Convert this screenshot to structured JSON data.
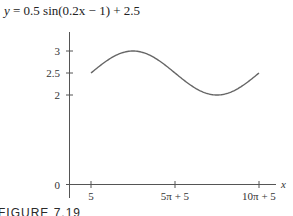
{
  "title": {
    "prefix": "y",
    "equation": " = 0.5 sin(0.2x − 1) + 2.5"
  },
  "caption": "FIGURE 7.19",
  "chart_data": {
    "type": "line",
    "title": "y = 0.5 sin(0.2x − 1) + 2.5",
    "xlabel": "x",
    "ylabel": "",
    "function": "0.5*sin(0.2*x - 1) + 2.5",
    "x_domain": [
      5,
      36.4159
    ],
    "x_ticks": [
      {
        "value": 5,
        "label": "5"
      },
      {
        "value": 20.708,
        "label": "5π + 5"
      },
      {
        "value": 36.416,
        "label": "10π + 5"
      }
    ],
    "y_ticks": [
      {
        "value": 0,
        "label": "0"
      },
      {
        "value": 2,
        "label": "2"
      },
      {
        "value": 2.5,
        "label": "2.5"
      },
      {
        "value": 3,
        "label": "3"
      }
    ],
    "key_points": [
      {
        "x": 5,
        "y": 2.5
      },
      {
        "x": 12.854,
        "y": 3
      },
      {
        "x": 20.708,
        "y": 2.5
      },
      {
        "x": 28.562,
        "y": 2
      },
      {
        "x": 36.416,
        "y": 2.5
      }
    ],
    "grid": false,
    "legend": "none"
  }
}
